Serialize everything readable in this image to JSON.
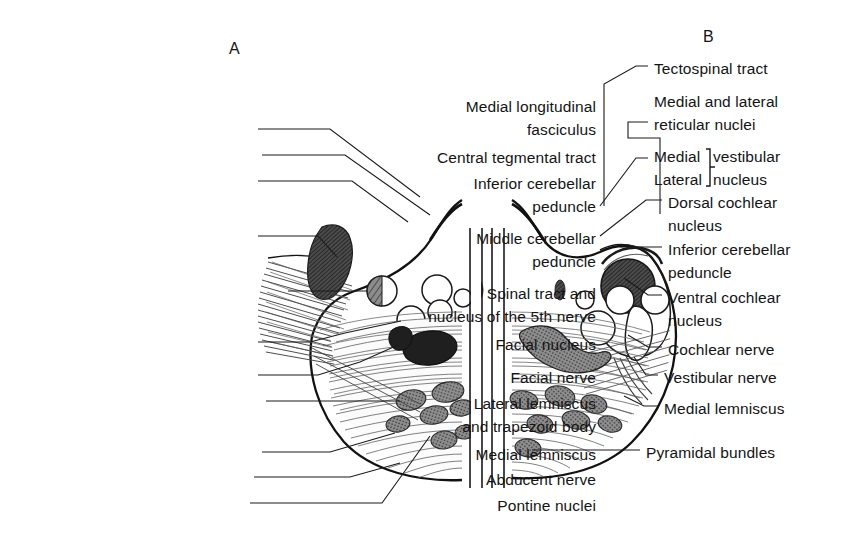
{
  "figure": {
    "panel_a_tag": "A",
    "panel_b_tag": "B",
    "panel_a_tag_pos": {
      "x": 229,
      "y": 40
    },
    "panel_b_tag_pos": {
      "x": 703,
      "y": 28
    }
  },
  "labels_left": [
    {
      "name": "medial-longitudinal-fasciculus",
      "lines": [
        "Medial longitudinal",
        "fasciculus"
      ],
      "right": 596,
      "top": 96,
      "leader": "M 258 129 L 330 129 L 420 197"
    },
    {
      "name": "central-tegmental-tract",
      "lines": [
        "Central tegmental tract"
      ],
      "right": 596,
      "top": 147,
      "leader": "M 262 155 L 345 155 L 430 215"
    },
    {
      "name": "inferior-cerebellar-peduncle",
      "lines": [
        "Inferior cerebellar",
        "peduncle"
      ],
      "right": 596,
      "top": 173,
      "leader": "M 258 181 L 352 181 L 408 222"
    },
    {
      "name": "middle-cerebellar-peduncle",
      "lines": [
        "Middle cerebellar",
        "peduncle"
      ],
      "right": 596,
      "top": 228,
      "leader": "M 258 236 L 318 236 L 337 257"
    },
    {
      "name": "spinal-tract-and-nucleus-5th-nerve",
      "lines": [
        "Spinal tract and",
        "nucleus of the 5th nerve"
      ],
      "right": 596,
      "top": 283,
      "leader": "M 288 291 L 368 291"
    },
    {
      "name": "facial-nucleus",
      "lines": [
        "Facial nucleus"
      ],
      "right": 596,
      "top": 334,
      "leader": "M 258 342 L 310 342 L 345 333 L 401 321"
    },
    {
      "name": "facial-nerve",
      "lines": [
        "Facial nerve"
      ],
      "right": 596,
      "top": 367,
      "leader": "M 258 375 L 318 375 L 360 362 L 398 345"
    },
    {
      "name": "lateral-lemniscus-and-trapezoid-body",
      "lines": [
        "Lateral lemniscus",
        "and trapezoid body"
      ],
      "right": 596,
      "top": 393,
      "leader": "M 266 401 L 400 401"
    },
    {
      "name": "medial-lemniscus",
      "lines": [
        "Medial lemniscus"
      ],
      "right": 596,
      "top": 444,
      "leader": "M 262 452 L 330 452 L 395 433"
    },
    {
      "name": "abducent-nerve",
      "lines": [
        "Abducent nerve"
      ],
      "right": 596,
      "top": 469,
      "leader": "M 254 477 L 350 477 L 400 463"
    },
    {
      "name": "pontine-nuclei",
      "lines": [
        "Pontine nuclei"
      ],
      "right": 596,
      "top": 495,
      "leader": "M 250 503 L 382 503 L 430 436"
    }
  ],
  "labels_right": [
    {
      "name": "tectospinal-tract",
      "lines": [
        "Tectospinal tract"
      ],
      "left": 654,
      "top": 58,
      "leader": "M 648 66 L 636 66 L 604 84 L 604 206"
    },
    {
      "name": "medial-and-lateral-reticular-nuclei",
      "lines": [
        "Medial and lateral",
        "reticular nuclei"
      ],
      "left": 654,
      "top": 91,
      "leader": "M 648 122 L 628 122 L 628 138 L 660 138 L 660 214"
    },
    {
      "name": "medial-lateral-vestibular-nucleus",
      "lines": [
        "Medial",
        "Lateral"
      ],
      "left": 654,
      "top": 146,
      "bracket_lines": [
        "vestibular",
        "nucleus"
      ],
      "bracket_left": 713,
      "leader": "M 648 158 L 636 158 L 600 206"
    },
    {
      "name": "dorsal-cochlear-nucleus",
      "lines": [
        "Dorsal cochlear",
        "nucleus"
      ],
      "left": 668,
      "top": 192,
      "leader": "M 662 200 L 646 200 L 600 236"
    },
    {
      "name": "inferior-cerebellar-peduncle-right",
      "lines": [
        "Inferior cerebellar",
        "peduncle"
      ],
      "left": 668,
      "top": 239,
      "leader": "M 662 247 L 620 247"
    },
    {
      "name": "ventral-cochlear-nucleus",
      "lines": [
        "Ventral cochlear",
        "nucleus"
      ],
      "left": 668,
      "top": 287,
      "leader": "M 662 295 L 648 295 L 624 278"
    },
    {
      "name": "cochlear-nerve",
      "lines": [
        "Cochlear nerve"
      ],
      "left": 668,
      "top": 339,
      "leader": "M 662 347 L 648 347 L 628 335"
    },
    {
      "name": "vestibular-nerve",
      "lines": [
        "Vestibular nerve"
      ],
      "left": 664,
      "top": 367,
      "leader": "M 658 375 L 646 375 L 634 357"
    },
    {
      "name": "medial-lemniscus-right",
      "lines": [
        "Medial lemniscus"
      ],
      "left": 664,
      "top": 398,
      "leader": "M 658 406 L 644 406 L 624 396"
    },
    {
      "name": "pyramidal-bundles",
      "lines": [
        "Pyramidal bundles"
      ],
      "left": 646,
      "top": 442,
      "leader": "M 640 450 L 532 450"
    }
  ],
  "colors": {
    "ink": "#141414",
    "outline": "#111111",
    "fill_dark": "#3a3a3a",
    "fill_mid": "#6b6b6b",
    "fill_light": "#9a9a9a",
    "background": "#ffffff"
  }
}
